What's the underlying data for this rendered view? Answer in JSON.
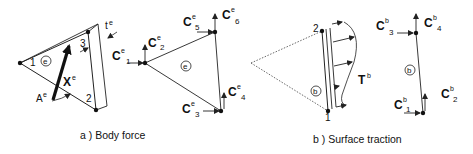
{
  "figure": {
    "panel_a": {
      "caption": "a )  Body  force",
      "element_label": "e",
      "body_force_label": "X",
      "body_force_sup": "e",
      "area_label": "A",
      "area_sup": "e",
      "thickness_label": "t",
      "thickness_sup": "e",
      "node_labels": [
        "1",
        "2",
        "3"
      ],
      "nodal_forces": [
        {
          "base": "C",
          "sup": "e",
          "sub": "1"
        },
        {
          "base": "C",
          "sup": "e",
          "sub": "2"
        },
        {
          "base": "C",
          "sup": "e",
          "sub": "3"
        },
        {
          "base": "C",
          "sup": "e",
          "sub": "4"
        },
        {
          "base": "C",
          "sup": "e",
          "sub": "5"
        },
        {
          "base": "C",
          "sup": "e",
          "sub": "6"
        }
      ]
    },
    "panel_b": {
      "caption": "b )  Surface  traction",
      "boundary_label": "b",
      "traction_label": "T",
      "traction_sup": "b",
      "node_labels": [
        "1",
        "2"
      ],
      "nodal_forces": [
        {
          "base": "C",
          "sup": "b",
          "sub": "1"
        },
        {
          "base": "C",
          "sup": "b",
          "sub": "2"
        },
        {
          "base": "C",
          "sup": "b",
          "sub": "3"
        },
        {
          "base": "C",
          "sup": "b",
          "sub": "4"
        }
      ]
    },
    "colors": {
      "line": "#222222",
      "background": "#ffffff"
    }
  }
}
